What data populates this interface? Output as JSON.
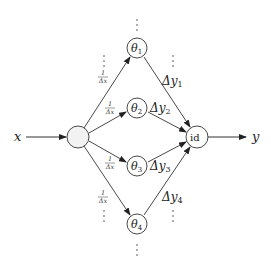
{
  "diagram": {
    "input_label": "x",
    "output_label": "y",
    "input_node_label": "",
    "output_node_label": "id",
    "hidden_nodes": [
      {
        "label": "θ",
        "sub": "1",
        "weight_in": {
          "num": "1",
          "den": "Δx"
        },
        "weight_out": {
          "delta": "Δy",
          "sub": "1"
        }
      },
      {
        "label": "θ",
        "sub": "2",
        "weight_in": {
          "num": "1",
          "den": "Δx"
        },
        "weight_out": {
          "delta": "Δy",
          "sub": "2"
        }
      },
      {
        "label": "θ",
        "sub": "3",
        "weight_in": {
          "num": "1",
          "den": "Δx"
        },
        "weight_out": {
          "delta": "Δy",
          "sub": "3"
        }
      },
      {
        "label": "θ",
        "sub": "4",
        "weight_in": {
          "num": "1",
          "den": "Δx"
        },
        "weight_out": {
          "delta": "Δy",
          "sub": "4"
        }
      }
    ],
    "ellipsis": "⋮",
    "colors": {
      "stroke": "#333333",
      "input_node_fill": "#f2f2f2",
      "node_fill": "#ffffff",
      "text": "#222222"
    }
  }
}
